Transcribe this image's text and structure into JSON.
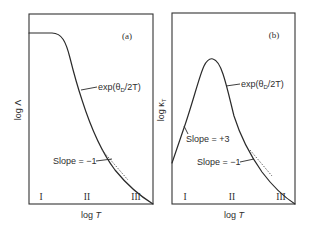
{
  "panels": [
    {
      "tag": "(a)",
      "ylabel_main": "log Λ",
      "xlabel_main": "log ",
      "xlabel_var": "T",
      "annotations": {
        "exp_prefix": "exp(θ",
        "exp_sub": "D",
        "exp_suffix": "/2T)",
        "slope_neg": "Slope = −1"
      },
      "regions": [
        "I",
        "II",
        "III"
      ]
    },
    {
      "tag": "(b)",
      "ylabel_main": "log κ",
      "ylabel_sub": "T",
      "xlabel_main": "log ",
      "xlabel_var": "T",
      "annotations": {
        "exp_prefix": "exp(θ",
        "exp_sub": "D",
        "exp_suffix": "/2T)",
        "slope_pos": "Slope = +3",
        "slope_neg": "Slope = −1"
      },
      "regions": [
        "I",
        "II",
        "III"
      ]
    }
  ],
  "colors": {
    "line": "#2a2a2a",
    "text": "#2e2e2e",
    "background": "#ffffff"
  }
}
